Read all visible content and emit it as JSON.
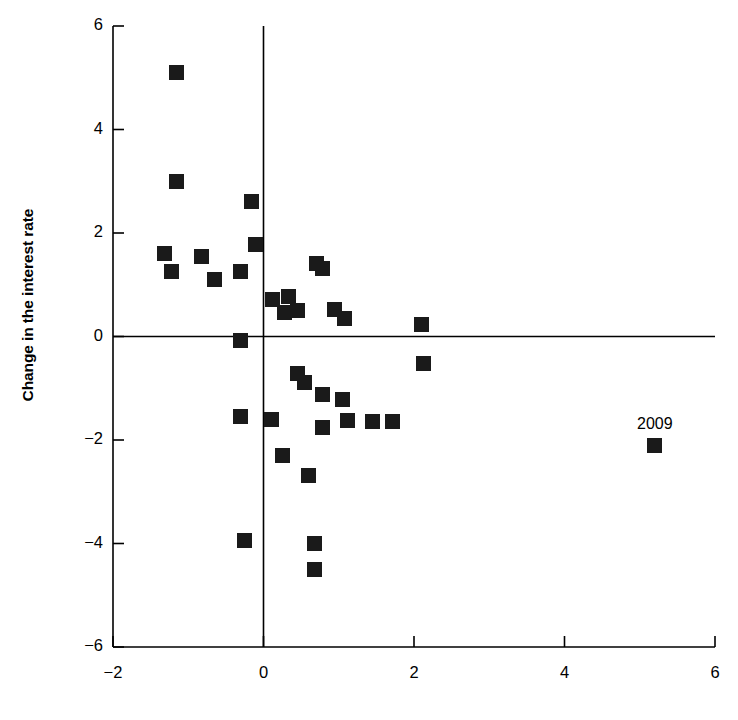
{
  "chart_data": {
    "type": "scatter",
    "title": "",
    "xlabel": "",
    "ylabel": "Change in the interest rate",
    "xlim": [
      -2,
      6
    ],
    "ylim": [
      -6,
      6
    ],
    "xticks": [
      -2,
      0,
      2,
      4,
      6
    ],
    "yticks": [
      -6,
      -4,
      -2,
      0,
      2,
      4,
      6
    ],
    "xticklabels": [
      "−2",
      "0",
      "2",
      "4",
      "6"
    ],
    "yticklabels": [
      "−6",
      "−4",
      "−2",
      "0",
      "2",
      "4",
      "6"
    ],
    "grid": false,
    "legend": false,
    "marker": "square",
    "marker_color": "#1a1a1a",
    "axis_color": "#000000",
    "crosshair_axes": true,
    "points": [
      {
        "x": -1.15,
        "y": 5.1
      },
      {
        "x": -1.15,
        "y": 3.0
      },
      {
        "x": -1.32,
        "y": 1.6
      },
      {
        "x": -1.22,
        "y": 1.25
      },
      {
        "x": -0.82,
        "y": 1.55
      },
      {
        "x": -0.65,
        "y": 1.1
      },
      {
        "x": -0.3,
        "y": 1.25
      },
      {
        "x": -0.16,
        "y": 2.6
      },
      {
        "x": -0.1,
        "y": 1.78
      },
      {
        "x": -0.3,
        "y": -0.07
      },
      {
        "x": 0.12,
        "y": 0.72
      },
      {
        "x": 0.28,
        "y": 0.46
      },
      {
        "x": 0.33,
        "y": 0.78
      },
      {
        "x": 0.45,
        "y": 0.5
      },
      {
        "x": 0.7,
        "y": 1.42
      },
      {
        "x": 0.78,
        "y": 1.32
      },
      {
        "x": 0.95,
        "y": 0.52
      },
      {
        "x": 1.08,
        "y": 0.35
      },
      {
        "x": 2.1,
        "y": 0.23
      },
      {
        "x": 0.45,
        "y": -0.72
      },
      {
        "x": 0.55,
        "y": -0.88
      },
      {
        "x": 0.78,
        "y": -1.12
      },
      {
        "x": 1.05,
        "y": -1.22
      },
      {
        "x": 2.12,
        "y": -0.52
      },
      {
        "x": -0.3,
        "y": -1.55
      },
      {
        "x": 0.1,
        "y": -1.6
      },
      {
        "x": 0.78,
        "y": -1.75
      },
      {
        "x": 1.12,
        "y": -1.62
      },
      {
        "x": 1.45,
        "y": -1.65
      },
      {
        "x": 1.72,
        "y": -1.65
      },
      {
        "x": 0.25,
        "y": -2.3
      },
      {
        "x": 0.6,
        "y": -2.68
      },
      {
        "x": -0.25,
        "y": -3.95
      },
      {
        "x": 0.68,
        "y": -4.0
      },
      {
        "x": 0.68,
        "y": -4.5
      },
      {
        "x": 5.2,
        "y": -2.1,
        "label": "2009"
      }
    ]
  }
}
